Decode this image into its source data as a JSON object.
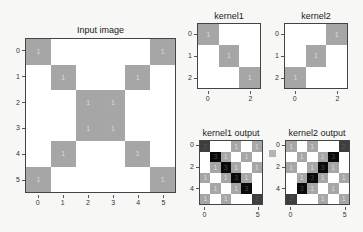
{
  "chart_data": [
    {
      "type": "heatmap",
      "title": "Input image",
      "x_ticks": [
        "0",
        "1",
        "2",
        "3",
        "4",
        "5"
      ],
      "y_ticks": [
        "0",
        "1",
        "2",
        "3",
        "4",
        "5"
      ],
      "values": [
        [
          1,
          0,
          0,
          0,
          0,
          1
        ],
        [
          0,
          1,
          0,
          0,
          1,
          0
        ],
        [
          0,
          0,
          1,
          1,
          0,
          0
        ],
        [
          0,
          0,
          1,
          1,
          0,
          0
        ],
        [
          0,
          1,
          0,
          0,
          1,
          0
        ],
        [
          1,
          0,
          0,
          0,
          0,
          1
        ]
      ],
      "colormap": "gray_r",
      "cell_labels": "value shown on nonzero cells"
    },
    {
      "type": "heatmap",
      "title": "kernel1",
      "x_ticks": [
        "0",
        "2"
      ],
      "y_ticks": [
        "0",
        "1",
        "2"
      ],
      "values": [
        [
          1,
          0,
          0
        ],
        [
          0,
          1,
          0
        ],
        [
          0,
          0,
          1
        ]
      ],
      "colormap": "gray_r"
    },
    {
      "type": "heatmap",
      "title": "kernel2",
      "x_ticks": [
        "0",
        "2"
      ],
      "y_ticks": [
        "0",
        "1",
        "2"
      ],
      "values": [
        [
          0,
          0,
          1
        ],
        [
          0,
          1,
          0
        ],
        [
          1,
          0,
          0
        ]
      ],
      "colormap": "gray_r"
    },
    {
      "type": "heatmap",
      "title": "kernel1 output",
      "x_ticks": [
        "0",
        "5"
      ],
      "y_ticks": [
        "0",
        "2",
        "4"
      ],
      "values": [
        [
          2,
          0,
          0,
          1,
          0,
          1
        ],
        [
          0,
          3,
          1,
          0,
          1,
          0
        ],
        [
          0,
          1,
          3,
          1,
          0,
          1
        ],
        [
          1,
          0,
          1,
          3,
          1,
          0
        ],
        [
          0,
          1,
          0,
          1,
          3,
          0
        ],
        [
          1,
          0,
          1,
          0,
          0,
          2
        ]
      ],
      "colormap": "gray_r"
    },
    {
      "type": "heatmap",
      "title": "kernel2 output",
      "x_ticks": [
        "0",
        "5"
      ],
      "y_ticks": [
        "0",
        "2",
        "4"
      ],
      "values": [
        [
          1,
          0,
          1,
          0,
          0,
          2
        ],
        [
          0,
          1,
          0,
          1,
          3,
          0
        ],
        [
          1,
          0,
          1,
          3,
          1,
          0
        ],
        [
          0,
          1,
          3,
          1,
          0,
          1
        ],
        [
          0,
          3,
          1,
          0,
          1,
          0
        ],
        [
          2,
          0,
          0,
          1,
          0,
          1
        ]
      ],
      "colormap": "gray_r"
    }
  ],
  "panels": {
    "input": {
      "title": "Input image"
    },
    "kernel1": {
      "title": "kernel1"
    },
    "kernel2": {
      "title": "kernel2"
    },
    "out1": {
      "title": "kernel1 output"
    },
    "out2": {
      "title": "kernel2 output"
    }
  }
}
